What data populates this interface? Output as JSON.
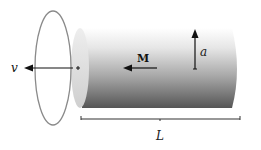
{
  "diagram": {
    "labels": {
      "velocity": "v",
      "magnetization": "M",
      "radius": "a",
      "length": "L"
    },
    "colors": {
      "ring": "#8a8a8a",
      "cylinder_light": "#f2f2f2",
      "cylinder_dark": "#5a5a5a",
      "end_cap": "#d6d6d6",
      "arrow": "#111111",
      "bracket": "#333333"
    }
  }
}
